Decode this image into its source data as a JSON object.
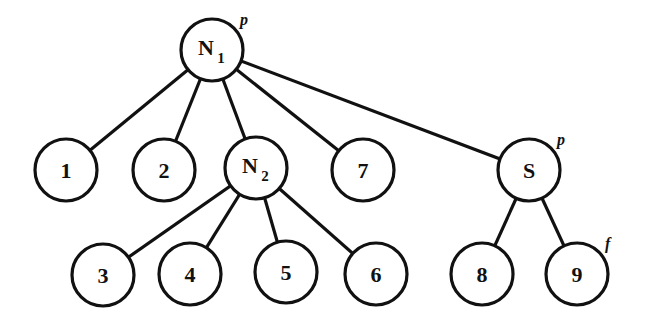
{
  "diagram": {
    "type": "tree",
    "nodes": [
      {
        "id": "N1",
        "label": "N",
        "sub": "1",
        "x": 212,
        "y": 50,
        "mark": "p"
      },
      {
        "id": "1",
        "label": "1",
        "sub": "",
        "x": 66,
        "y": 170,
        "mark": ""
      },
      {
        "id": "2",
        "label": "2",
        "sub": "",
        "x": 164,
        "y": 170,
        "mark": ""
      },
      {
        "id": "N2",
        "label": "N",
        "sub": "2",
        "x": 256,
        "y": 168,
        "mark": ""
      },
      {
        "id": "7",
        "label": "7",
        "sub": "",
        "x": 363,
        "y": 170,
        "mark": ""
      },
      {
        "id": "S",
        "label": "S",
        "sub": "",
        "x": 529,
        "y": 170,
        "mark": "p"
      },
      {
        "id": "3",
        "label": "3",
        "sub": "",
        "x": 103,
        "y": 275,
        "mark": ""
      },
      {
        "id": "4",
        "label": "4",
        "sub": "",
        "x": 190,
        "y": 274,
        "mark": ""
      },
      {
        "id": "5",
        "label": "5",
        "sub": "",
        "x": 286,
        "y": 272,
        "mark": ""
      },
      {
        "id": "6",
        "label": "6",
        "sub": "",
        "x": 376,
        "y": 274,
        "mark": ""
      },
      {
        "id": "8",
        "label": "8",
        "sub": "",
        "x": 482,
        "y": 274,
        "mark": ""
      },
      {
        "id": "9",
        "label": "9",
        "sub": "",
        "x": 577,
        "y": 274,
        "mark": "f"
      }
    ],
    "edges": [
      [
        "N1",
        "1"
      ],
      [
        "N1",
        "2"
      ],
      [
        "N1",
        "N2"
      ],
      [
        "N1",
        "7"
      ],
      [
        "N1",
        "S"
      ],
      [
        "N2",
        "3"
      ],
      [
        "N2",
        "4"
      ],
      [
        "N2",
        "5"
      ],
      [
        "N2",
        "6"
      ],
      [
        "S",
        "8"
      ],
      [
        "S",
        "9"
      ]
    ],
    "radius": 31
  }
}
